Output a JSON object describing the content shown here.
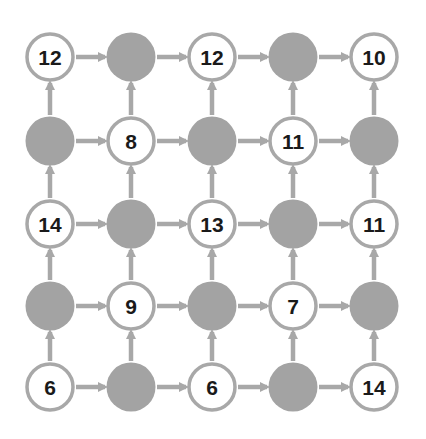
{
  "diagram": {
    "type": "grid-flow",
    "rows": 5,
    "cols": 5,
    "colors": {
      "filled_node": "#a3a3a3",
      "node_border": "#a8a8a8",
      "empty_node_fill": "#ffffff",
      "arrow": "#a8a8a8",
      "text": "#1a1a1a"
    },
    "grid": [
      [
        "12",
        null,
        "12",
        null,
        "10"
      ],
      [
        null,
        "8",
        null,
        "11",
        null
      ],
      [
        "14",
        null,
        "13",
        null,
        "11"
      ],
      [
        null,
        "9",
        null,
        "7",
        null
      ],
      [
        "6",
        null,
        "6",
        null,
        "14"
      ]
    ],
    "arrow_directions": [
      "right",
      "up"
    ]
  }
}
